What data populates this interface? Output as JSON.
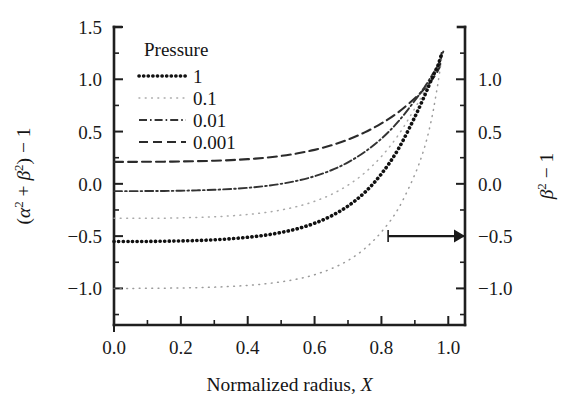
{
  "chart_data": {
    "type": "line",
    "title": "",
    "xlabel": "Normalized radius, X",
    "ylabel": "(α² + β²) − 1",
    "ylabel_right": "β² − 1",
    "xlim": [
      0.0,
      1.05
    ],
    "ylim": [
      -1.35,
      1.5
    ],
    "ylim_right": [
      -1.35,
      1.5
    ],
    "grid": false,
    "legend_position": "upper-left-inside",
    "legend_title": "Pressure",
    "xticks": [
      0.0,
      0.2,
      0.4,
      0.6,
      0.8,
      1.0
    ],
    "xticklabels": [
      "0.0",
      "0.2",
      "0.4",
      "0.6",
      "0.8",
      "1.0"
    ],
    "xminorticks": [
      0.1,
      0.3,
      0.5,
      0.7,
      0.9
    ],
    "yticks": [
      1.5,
      1.0,
      0.5,
      0.0,
      -0.5,
      -1.0
    ],
    "yticklabels": [
      "1.5",
      "1.0",
      "0.5",
      "0.0",
      "−0.5",
      "−1.0"
    ],
    "yminorticks": [
      1.25,
      0.75,
      0.25,
      -0.25,
      -0.75,
      -1.25
    ],
    "yticks_right": [
      1.0,
      0.5,
      0.0,
      -0.5,
      -1.0
    ],
    "yticklabels_right": [
      "1.0",
      "0.5",
      "0.0",
      "−0.5",
      "−1.0"
    ],
    "yminorticks_right": [
      1.25,
      0.75,
      0.25,
      -0.25,
      -0.75,
      -1.25
    ],
    "annotation": {
      "type": "arrow",
      "text": "",
      "from_x": 0.82,
      "from_y": -0.5,
      "to_x": 1.05,
      "to_y": -0.5,
      "points_to": "right-axis"
    },
    "series": [
      {
        "name": "0.001",
        "label": "0.001",
        "linestyle": "dashed",
        "color": "#2b2b2b",
        "plateau": 0.21,
        "x": [
          0.0,
          0.05,
          0.1,
          0.15,
          0.2,
          0.25,
          0.3,
          0.35,
          0.4,
          0.45,
          0.5,
          0.55,
          0.6,
          0.65,
          0.7,
          0.75,
          0.8,
          0.85,
          0.9,
          0.93,
          0.95,
          0.96,
          0.97,
          0.975,
          0.98
        ],
        "y": [
          0.21,
          0.21,
          0.211,
          0.212,
          0.214,
          0.217,
          0.221,
          0.227,
          0.236,
          0.249,
          0.267,
          0.292,
          0.325,
          0.368,
          0.423,
          0.492,
          0.578,
          0.684,
          0.818,
          0.913,
          0.99,
          1.035,
          1.09,
          1.13,
          1.25
        ]
      },
      {
        "name": "0.01",
        "label": "0.01",
        "linestyle": "dashdot",
        "color": "#333333",
        "plateau": -0.07,
        "x": [
          0.0,
          0.05,
          0.1,
          0.15,
          0.2,
          0.25,
          0.3,
          0.35,
          0.4,
          0.45,
          0.5,
          0.55,
          0.6,
          0.65,
          0.7,
          0.75,
          0.8,
          0.85,
          0.9,
          0.93,
          0.95,
          0.96,
          0.97,
          0.975,
          0.985
        ],
        "y": [
          -0.07,
          -0.07,
          -0.069,
          -0.068,
          -0.066,
          -0.062,
          -0.057,
          -0.049,
          -0.038,
          -0.022,
          0.0,
          0.031,
          0.073,
          0.13,
          0.206,
          0.305,
          0.432,
          0.594,
          0.797,
          0.93,
          1.032,
          1.082,
          1.14,
          1.18,
          1.265
        ]
      },
      {
        "name": "0.1-faint",
        "label": "0.1",
        "linestyle": "fine-dotted",
        "color": "#9a9a9a",
        "plateau": -0.33,
        "x": [
          0.0,
          0.05,
          0.1,
          0.15,
          0.2,
          0.25,
          0.3,
          0.35,
          0.4,
          0.45,
          0.5,
          0.55,
          0.6,
          0.65,
          0.7,
          0.75,
          0.8,
          0.85,
          0.9,
          0.93,
          0.95,
          0.96,
          0.97,
          0.98
        ],
        "y": [
          -0.33,
          -0.33,
          -0.329,
          -0.328,
          -0.325,
          -0.321,
          -0.315,
          -0.306,
          -0.293,
          -0.275,
          -0.25,
          -0.215,
          -0.167,
          -0.102,
          -0.013,
          0.105,
          0.262,
          0.464,
          0.722,
          0.895,
          1.02,
          1.08,
          1.14,
          1.235
        ]
      },
      {
        "name": "1",
        "label": "1",
        "linestyle": "bold-dotted",
        "color": "#111111",
        "plateau": -0.55,
        "x": [
          0.0,
          0.05,
          0.1,
          0.15,
          0.2,
          0.25,
          0.3,
          0.35,
          0.4,
          0.45,
          0.5,
          0.55,
          0.6,
          0.65,
          0.7,
          0.75,
          0.8,
          0.85,
          0.9,
          0.93,
          0.95,
          0.96,
          0.97,
          0.98
        ],
        "y": [
          -0.552,
          -0.552,
          -0.551,
          -0.549,
          -0.546,
          -0.542,
          -0.535,
          -0.525,
          -0.511,
          -0.492,
          -0.465,
          -0.428,
          -0.377,
          -0.307,
          -0.212,
          -0.082,
          0.095,
          0.33,
          0.64,
          0.85,
          1.0,
          1.07,
          1.14,
          1.245
        ]
      },
      {
        "name": "lowest",
        "label": "",
        "linestyle": "fine-dotted",
        "color": "#8a8a8a",
        "plateau": -1.0,
        "x": [
          0.0,
          0.05,
          0.1,
          0.15,
          0.2,
          0.25,
          0.3,
          0.35,
          0.4,
          0.45,
          0.5,
          0.55,
          0.6,
          0.65,
          0.7,
          0.75,
          0.8,
          0.85,
          0.9,
          0.93,
          0.95,
          0.96,
          0.97,
          0.98
        ],
        "y": [
          -1.0,
          -1.0,
          -0.999,
          -0.998,
          -0.996,
          -0.993,
          -0.988,
          -0.981,
          -0.971,
          -0.957,
          -0.937,
          -0.909,
          -0.869,
          -0.812,
          -0.733,
          -0.62,
          -0.46,
          -0.24,
          0.09,
          0.36,
          0.62,
          0.79,
          0.98,
          1.2
        ]
      }
    ],
    "legend_entries": [
      {
        "label": "1",
        "linestyle": "bold-dotted",
        "color": "#111111"
      },
      {
        "label": "0.1",
        "linestyle": "fine-dotted",
        "color": "#9a9a9a"
      },
      {
        "label": "0.01",
        "linestyle": "dashdot",
        "color": "#333333"
      },
      {
        "label": "0.001",
        "linestyle": "dashed",
        "color": "#2b2b2b"
      }
    ]
  },
  "axes": {
    "left_label_parts": {
      "alpha": "α",
      "beta": "β",
      "expr": "(α² + β²) − 1"
    },
    "right_label_parts": {
      "expr": "β² − 1"
    },
    "x_label_prefix": "Normalized radius,",
    "x_label_var": "X"
  },
  "colors": {
    "axis": "#1f1f1f",
    "background": "#ffffff",
    "text": "#1a1a1a",
    "arrow": "#1a1a1a"
  }
}
